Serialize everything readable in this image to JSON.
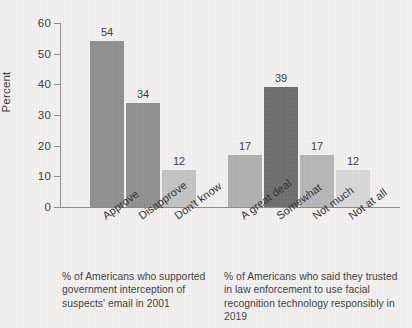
{
  "chart_data": {
    "type": "bar",
    "title": "",
    "subtitle": "",
    "xlabel": "",
    "ylabel": "Percent",
    "ylim": [
      0,
      60
    ],
    "ytick_values": [
      0,
      10,
      20,
      30,
      40,
      50,
      60
    ],
    "ytick_labels": [
      "0",
      "10",
      "20",
      "30",
      "40",
      "50",
      "60"
    ],
    "grid": false,
    "legend": "none",
    "categories": [
      "Approve",
      "Disapprove",
      "Don't know",
      "A great deal",
      "Somewhat",
      "Not much",
      "Not at all"
    ],
    "values": [
      54,
      34,
      12,
      17,
      39,
      17,
      12
    ],
    "value_labels": [
      "54",
      "34",
      "12",
      "17",
      "39",
      "17",
      "12"
    ],
    "bar_colors": [
      "#8f8f8f",
      "#909090",
      "#c3c3c3",
      "#b0b0b0",
      "#6e6e6e",
      "#b6b6b6",
      "#d8d8d8"
    ],
    "groups": [
      {
        "caption": "% of Americans who supported government interception of suspects' email in 2001",
        "categories": [
          "Approve",
          "Disapprove",
          "Don't know"
        ],
        "values": [
          54,
          34,
          12
        ]
      },
      {
        "caption": "% of Americans who said they trusted in law enforcement to use facial recognition technology responsibly in 2019",
        "categories": [
          "A great deal",
          "Somewhat",
          "Not much",
          "Not at all"
        ],
        "values": [
          17,
          39,
          17,
          12
        ]
      }
    ],
    "axis_color": "#8d8d8d",
    "background_color": "#f2f1ef",
    "text_color": "#3b3b3b"
  },
  "captions": {
    "left": "% of Americans who supported government interception of suspects' email in 2001",
    "right": "% of Americans who said they trusted in law enforcement to use facial recognition technology responsibly in 2019"
  }
}
